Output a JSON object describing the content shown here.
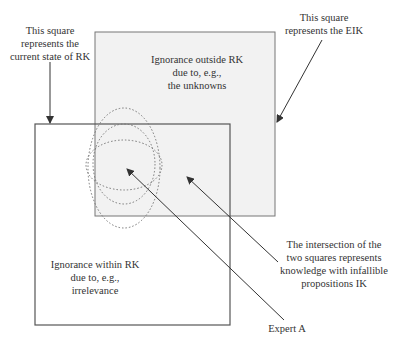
{
  "diagram": {
    "labels": {
      "rk_square": [
        "This square",
        "represents the",
        "current state of RK"
      ],
      "eik_square": [
        "This square",
        "represents the EIK"
      ],
      "ignorance_outside": [
        "Ignorance outside RK",
        "due to, e.g.,",
        "the unknowns"
      ],
      "ignorance_within": [
        "Ignorance within RK",
        "due to, e.g.,",
        "irrelevance"
      ],
      "intersection": [
        "The intersection of the",
        "two squares represents",
        "knowledge with infallible",
        "propositions IK"
      ],
      "expert": "Expert A"
    },
    "shapes": {
      "eik_square": {
        "x": 95,
        "y": 32,
        "w": 180,
        "h": 184,
        "fill": "#f2f2f2",
        "stroke": "#777777"
      },
      "rk_square": {
        "x": 35,
        "y": 124,
        "w": 195,
        "h": 201,
        "fill": "none",
        "stroke": "#555555"
      },
      "expert_ellipses": [
        {
          "cx": 124,
          "cy": 168,
          "rx": 36,
          "ry": 60
        },
        {
          "cx": 124,
          "cy": 164,
          "rx": 31,
          "ry": 40
        },
        {
          "cx": 124,
          "cy": 165,
          "rx": 38,
          "ry": 25
        }
      ]
    },
    "arrows": [
      {
        "name": "rk-pointer-arrow",
        "x1": 50,
        "y1": 62,
        "x2": 50,
        "y2": 124
      },
      {
        "name": "eik-pointer-arrow",
        "x1": 322,
        "y1": 40,
        "x2": 276,
        "y2": 123
      },
      {
        "name": "ik-pointer-arrow",
        "x1": 278,
        "y1": 262,
        "x2": 186,
        "y2": 176
      },
      {
        "name": "expert-pointer-arrow",
        "x1": 284,
        "y1": 320,
        "x2": 126,
        "y2": 168
      }
    ]
  }
}
